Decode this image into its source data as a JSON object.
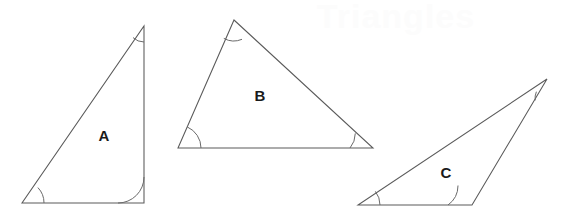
{
  "canvas": {
    "width": 567,
    "height": 223,
    "background_color": "#ffffff",
    "stroke_color": "#5a5a5a",
    "arc_color": "#6a6a6a",
    "label_color": "#1a1a1a"
  },
  "watermark": {
    "text": "Triangles",
    "color": "#fcfcfc",
    "x": 396,
    "y": 19
  },
  "figure": {
    "title": "Triangles",
    "shape_count": 3
  },
  "shapes": [
    {
      "id": "triangle-a",
      "label": "A",
      "label_x": 104,
      "label_y": 137,
      "points": "22,203 144,203 144,26",
      "vertices": [
        {
          "name": "bottom-left",
          "x": 22,
          "y": 203
        },
        {
          "name": "bottom-right",
          "x": 144,
          "y": 203
        },
        {
          "name": "apex",
          "x": 144,
          "y": 26
        }
      ],
      "arcs": [
        {
          "name": "arc-a-bottom-left",
          "d": "M 44,203 A 22,22 0 0 0 37.9,187.6"
        },
        {
          "name": "arc-a-bottom-right",
          "d": "M 118,203 A 26,26 0 0 0 144,177"
        },
        {
          "name": "arc-a-apex",
          "d": "M 144,42 A 16,16 0 0 1 133.0,37.6"
        }
      ]
    },
    {
      "id": "triangle-b",
      "label": "B",
      "label_x": 260,
      "label_y": 97,
      "points": "178,148 234,20 373,148",
      "vertices": [
        {
          "name": "bottom-left",
          "x": 178,
          "y": 148
        },
        {
          "name": "apex",
          "x": 234,
          "y": 20
        },
        {
          "name": "bottom-right",
          "x": 373,
          "y": 148
        }
      ],
      "arcs": [
        {
          "name": "arc-b-bottom-left",
          "d": "M 201,148 A 23,23 0 0 0 187.2,126.9"
        },
        {
          "name": "arc-b-apex",
          "d": "M 242.0,39.3 A 21,21 0 0 1 223.8,38.4"
        },
        {
          "name": "arc-b-bottom-right",
          "d": "M 350,148 A 23,23 0 0 0 355.3,133.4"
        }
      ]
    },
    {
      "id": "triangle-c",
      "label": "C",
      "label_x": 446,
      "label_y": 174,
      "points": "358,205 472,205 547,79",
      "vertices": [
        {
          "name": "bottom-left",
          "x": 358,
          "y": 205
        },
        {
          "name": "bottom-right",
          "x": 472,
          "y": 205
        },
        {
          "name": "apex",
          "x": 547,
          "y": 79
        }
      ],
      "arcs": [
        {
          "name": "arc-c-bottom-left",
          "d": "M 380,205 A 22,22 0 0 0 375.4,191.4"
        },
        {
          "name": "arc-c-bottom-right",
          "d": "M 448,205 A 24,24 0 0 0 458.0,185.5"
        },
        {
          "name": "arc-c-apex",
          "d": "M 536.4,91.7 A 16.5,16.5 0 0 0 535.2,100.4"
        }
      ]
    }
  ]
}
